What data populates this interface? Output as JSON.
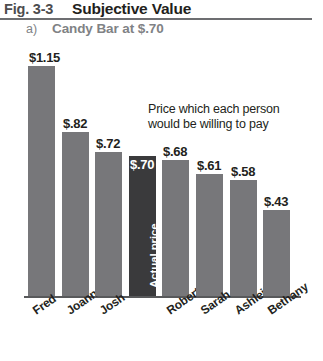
{
  "header": {
    "figure_number": "Fig. 3-3",
    "figure_title": "Subjective Value",
    "panel_letter": "a)",
    "panel_title": "Candy Bar at $.70"
  },
  "annotation": {
    "line1": "Price which each person",
    "line2": "would be willing to pay"
  },
  "actual_price_label": "Actual price",
  "chart_data": {
    "type": "bar",
    "title": "Subjective Value",
    "subtitle": "a) Candy Bar at $.70",
    "xlabel": "",
    "ylabel": "",
    "ylim": [
      0,
      1.15
    ],
    "grid": false,
    "legend": "none",
    "annotations": [
      "Price which each person would be willing to pay",
      "Actual price"
    ],
    "categories": [
      "Fred",
      "Joanna",
      "Josh",
      "",
      "Robert",
      "Sarah",
      "Ashleigh",
      "Bethany"
    ],
    "values": [
      1.15,
      0.82,
      0.72,
      0.7,
      0.68,
      0.61,
      0.58,
      0.43
    ],
    "value_labels": [
      "$1.15",
      "$.82",
      "$.72",
      "$.70",
      "$.68",
      "$.61",
      "$.58",
      "$.43"
    ],
    "bars": [
      {
        "name": "Fred",
        "value": 1.15,
        "label": "$1.15",
        "highlight": false
      },
      {
        "name": "Joanna",
        "value": 0.82,
        "label": "$.82",
        "highlight": false
      },
      {
        "name": "Josh",
        "value": 0.72,
        "label": "$.72",
        "highlight": false
      },
      {
        "name": "",
        "value": 0.7,
        "label": "$.70",
        "highlight": true
      },
      {
        "name": "Robert",
        "value": 0.68,
        "label": "$.68",
        "highlight": false
      },
      {
        "name": "Sarah",
        "value": 0.61,
        "label": "$.61",
        "highlight": false
      },
      {
        "name": "Ashleigh",
        "value": 0.58,
        "label": "$.58",
        "highlight": false
      },
      {
        "name": "Bethany",
        "value": 0.43,
        "label": "$.43",
        "highlight": false
      }
    ],
    "colors": {
      "bar": "#77777a",
      "highlight_bar": "#3a3a3c",
      "axis": "#58595b",
      "text": "#231f20",
      "muted_text": "#808285"
    }
  }
}
